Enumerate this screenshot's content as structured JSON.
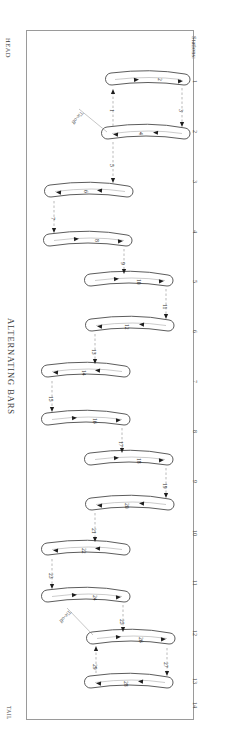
{
  "sheet": {
    "title": "ALTERNATING BARS",
    "head_label": "HEAD",
    "tail_label": "TAIL",
    "frame_color": "#9a9a9a",
    "bar_stroke_color": "#4a4a4a",
    "dash_color": "#9b9b9b",
    "arrow_color": "#1d1d1d"
  },
  "axis": {
    "caption": "Stations:",
    "stations": [
      "1",
      "2",
      "3",
      "4",
      "5",
      "6",
      "7",
      "8",
      "9",
      "10",
      "11",
      "12",
      "13",
      "14"
    ]
  },
  "annotations": [
    {
      "text": "Tie-off",
      "id": "tie-off-head"
    },
    {
      "text": "Tie-off",
      "id": "tie-off-tail"
    }
  ],
  "bars": [
    {
      "label": "2",
      "id": "bar-2"
    },
    {
      "label": "4",
      "id": "bar-4"
    },
    {
      "label": "6",
      "id": "bar-6"
    },
    {
      "label": "8",
      "id": "bar-8"
    },
    {
      "label": "10",
      "id": "bar-10"
    },
    {
      "label": "12",
      "id": "bar-12"
    },
    {
      "label": "14",
      "id": "bar-14"
    },
    {
      "label": "16",
      "id": "bar-16"
    },
    {
      "label": "18",
      "id": "bar-18"
    },
    {
      "label": "20",
      "id": "bar-20"
    },
    {
      "label": "22",
      "id": "bar-22"
    },
    {
      "label": "24",
      "id": "bar-24"
    },
    {
      "label": "26",
      "id": "bar-26"
    },
    {
      "label": "28",
      "id": "bar-28"
    }
  ],
  "connectors": [
    {
      "label": "1",
      "id": "connector-1"
    },
    {
      "label": "3",
      "id": "connector-3"
    },
    {
      "label": "5",
      "id": "connector-5"
    },
    {
      "label": "7",
      "id": "connector-7"
    },
    {
      "label": "9",
      "id": "connector-9"
    },
    {
      "label": "11",
      "id": "connector-11"
    },
    {
      "label": "13",
      "id": "connector-13"
    },
    {
      "label": "15",
      "id": "connector-15"
    },
    {
      "label": "17",
      "id": "connector-17"
    },
    {
      "label": "19",
      "id": "connector-19"
    },
    {
      "label": "21",
      "id": "connector-21"
    },
    {
      "label": "23",
      "id": "connector-23"
    },
    {
      "label": "25",
      "id": "connector-25"
    },
    {
      "label": "27",
      "id": "connector-27"
    },
    {
      "label": "29",
      "id": "connector-29"
    }
  ]
}
